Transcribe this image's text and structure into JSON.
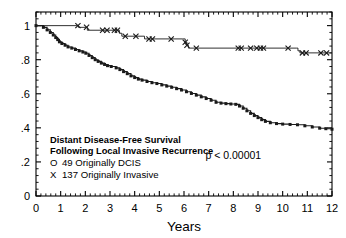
{
  "figure": {
    "background": "#ffffff",
    "frame_color": "#000000",
    "curve_color": "#1a1a1a"
  },
  "chart_data": {
    "type": "line",
    "title": "",
    "xlabel": "Years",
    "ylabel": "",
    "xlim": [
      0,
      12
    ],
    "ylim": [
      0,
      1.08
    ],
    "grid": false,
    "legend_position": "lower-left-inside",
    "xticks": [
      0,
      1,
      2,
      3,
      4,
      5,
      6,
      7,
      8,
      9,
      10,
      11,
      12
    ],
    "xtick_labels": [
      "0",
      "1",
      "2",
      "3",
      "4",
      "5",
      "6",
      "7",
      "8",
      "9",
      "10",
      "11",
      "12"
    ],
    "x_minor_ticks_per_interval": 4,
    "yticks": [
      0,
      0.2,
      0.4,
      0.6,
      0.8,
      1.0
    ],
    "ytick_labels": [
      "0",
      ".2",
      ".4",
      ".6",
      ".8",
      "1"
    ],
    "y_minor_ticks_per_interval": 4,
    "annotations": [
      {
        "name": "p-value",
        "text": "p < 0.00001",
        "x": 8.0,
        "y": 0.215
      }
    ],
    "legend_block": {
      "line1": "Distant Disease-Free Survival",
      "line2": "Following Local Invasive Recurrence",
      "line3_symbol": "O",
      "line3_text": "49 Originally DCIS",
      "line4_symbol": "X",
      "line4_text": "137 Originally Invasive"
    },
    "series": [
      {
        "name": "137 Originally Invasive",
        "symbol": "X",
        "marker": "x",
        "n": 137,
        "final_value": 0.84,
        "points": [
          [
            0.0,
            1.0
          ],
          [
            1.7,
            1.0
          ],
          [
            1.72,
            0.99
          ],
          [
            2.05,
            0.99
          ],
          [
            2.08,
            0.973
          ],
          [
            3.3,
            0.973
          ],
          [
            3.38,
            0.955
          ],
          [
            3.48,
            0.938
          ],
          [
            4.3,
            0.938
          ],
          [
            4.4,
            0.922
          ],
          [
            5.95,
            0.922
          ],
          [
            6.05,
            0.902
          ],
          [
            6.12,
            0.885
          ],
          [
            6.18,
            0.868
          ],
          [
            10.55,
            0.868
          ],
          [
            10.62,
            0.852
          ],
          [
            10.7,
            0.84
          ],
          [
            12.0,
            0.84
          ]
        ],
        "censor_marks": [
          [
            1.7,
            1.0
          ],
          [
            2.05,
            0.99
          ],
          [
            2.7,
            0.973
          ],
          [
            2.88,
            0.973
          ],
          [
            3.18,
            0.973
          ],
          [
            3.3,
            0.973
          ],
          [
            3.62,
            0.938
          ],
          [
            4.05,
            0.938
          ],
          [
            4.58,
            0.922
          ],
          [
            4.72,
            0.922
          ],
          [
            5.48,
            0.922
          ],
          [
            6.05,
            0.902
          ],
          [
            6.12,
            0.885
          ],
          [
            6.5,
            0.868
          ],
          [
            8.2,
            0.868
          ],
          [
            8.32,
            0.868
          ],
          [
            8.7,
            0.868
          ],
          [
            8.95,
            0.868
          ],
          [
            9.1,
            0.868
          ],
          [
            9.22,
            0.868
          ],
          [
            10.22,
            0.868
          ],
          [
            10.8,
            0.84
          ],
          [
            10.95,
            0.84
          ],
          [
            11.55,
            0.84
          ],
          [
            11.78,
            0.84
          ]
        ]
      },
      {
        "name": "49 Originally DCIS",
        "symbol": "O",
        "marker": "square",
        "n": 49,
        "final_value": 0.39,
        "points": [
          [
            0.0,
            1.0
          ],
          [
            0.3,
            0.99
          ],
          [
            0.45,
            0.975
          ],
          [
            0.58,
            0.96
          ],
          [
            0.7,
            0.945
          ],
          [
            0.8,
            0.93
          ],
          [
            0.88,
            0.918
          ],
          [
            0.95,
            0.905
          ],
          [
            1.05,
            0.895
          ],
          [
            1.18,
            0.885
          ],
          [
            1.3,
            0.875
          ],
          [
            1.45,
            0.868
          ],
          [
            1.6,
            0.86
          ],
          [
            1.75,
            0.852
          ],
          [
            1.9,
            0.845
          ],
          [
            2.02,
            0.838
          ],
          [
            2.15,
            0.825
          ],
          [
            2.28,
            0.812
          ],
          [
            2.4,
            0.8
          ],
          [
            2.52,
            0.79
          ],
          [
            2.65,
            0.78
          ],
          [
            2.78,
            0.772
          ],
          [
            2.9,
            0.765
          ],
          [
            3.05,
            0.76
          ],
          [
            3.25,
            0.752
          ],
          [
            3.4,
            0.742
          ],
          [
            3.55,
            0.73
          ],
          [
            3.7,
            0.718
          ],
          [
            3.85,
            0.705
          ],
          [
            4.0,
            0.695
          ],
          [
            4.15,
            0.686
          ],
          [
            4.3,
            0.68
          ],
          [
            4.5,
            0.672
          ],
          [
            4.7,
            0.665
          ],
          [
            4.9,
            0.66
          ],
          [
            5.1,
            0.652
          ],
          [
            5.3,
            0.645
          ],
          [
            5.5,
            0.638
          ],
          [
            5.7,
            0.63
          ],
          [
            5.9,
            0.622
          ],
          [
            6.1,
            0.612
          ],
          [
            6.3,
            0.602
          ],
          [
            6.5,
            0.592
          ],
          [
            6.7,
            0.582
          ],
          [
            6.9,
            0.572
          ],
          [
            7.1,
            0.562
          ],
          [
            7.3,
            0.55
          ],
          [
            7.5,
            0.545
          ],
          [
            7.7,
            0.542
          ],
          [
            7.9,
            0.54
          ],
          [
            8.1,
            0.538
          ],
          [
            8.25,
            0.528
          ],
          [
            8.4,
            0.515
          ],
          [
            8.55,
            0.5
          ],
          [
            8.7,
            0.485
          ],
          [
            8.85,
            0.472
          ],
          [
            9.0,
            0.46
          ],
          [
            9.15,
            0.448
          ],
          [
            9.3,
            0.438
          ],
          [
            9.5,
            0.43
          ],
          [
            9.75,
            0.425
          ],
          [
            10.0,
            0.422
          ],
          [
            10.3,
            0.42
          ],
          [
            10.6,
            0.418
          ],
          [
            10.9,
            0.412
          ],
          [
            11.2,
            0.405
          ],
          [
            11.5,
            0.398
          ],
          [
            11.75,
            0.395
          ],
          [
            12.0,
            0.392
          ]
        ],
        "censor_marks": []
      }
    ]
  }
}
